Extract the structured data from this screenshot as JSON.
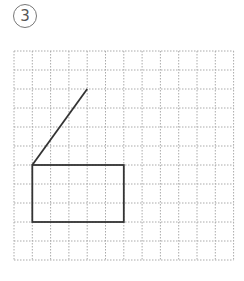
{
  "problem_label": "3",
  "grid": {
    "columns": 12,
    "rows": 11,
    "line_style": "dotted",
    "line_color": "#aaaaaa"
  },
  "shapes": {
    "segment": {
      "from": [
        1,
        6
      ],
      "to": [
        4,
        2
      ],
      "color": "#333333"
    },
    "rectangle": {
      "from": [
        1,
        6
      ],
      "to": [
        6,
        9
      ],
      "color": "#333333"
    }
  }
}
